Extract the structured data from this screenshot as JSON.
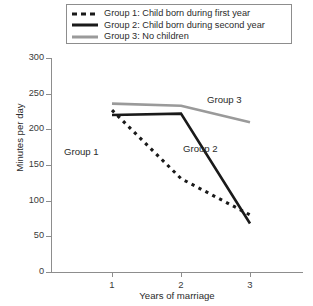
{
  "legend": {
    "items": [
      {
        "label": "Group 1: Child born during first year",
        "style": "dotted",
        "color": "#1a1a1a",
        "icon": "dotted-line-swatch"
      },
      {
        "label": "Group 2: Child born during second year",
        "style": "solid",
        "color": "#1a1a1a",
        "icon": "solid-line-swatch"
      },
      {
        "label": "Group 3: No children",
        "style": "solid",
        "color": "#9a9a9a",
        "icon": "solid-line-swatch"
      }
    ]
  },
  "annotations": {
    "group1": "Group 1",
    "group2": "Group 2",
    "group3": "Group 3"
  },
  "axes": {
    "y_ticks": [
      "300",
      "250",
      "200",
      "150",
      "100",
      "50",
      "0"
    ],
    "x_ticks": [
      "1",
      "2",
      "3"
    ],
    "ylabel": "Minutes per day",
    "xlabel": "Years of marriage"
  },
  "chart_data": {
    "type": "line",
    "title": "",
    "xlabel": "Years of marriage",
    "ylabel": "Minutes per day",
    "x": [
      1,
      2,
      3
    ],
    "xlim": [
      0.6,
      3.6
    ],
    "ylim": [
      0,
      300
    ],
    "yticks": [
      0,
      50,
      100,
      150,
      200,
      250,
      300
    ],
    "xticks": [
      1,
      2,
      3
    ],
    "grid": false,
    "legend_position": "top",
    "series": [
      {
        "name": "Group 1: Child born during first year",
        "short_name": "Group 1",
        "linestyle": "dotted",
        "color": "#1a1a1a",
        "values": [
          227,
          131,
          80
        ]
      },
      {
        "name": "Group 2: Child born during second year",
        "short_name": "Group 2",
        "linestyle": "solid",
        "color": "#1a1a1a",
        "values": [
          220,
          222,
          68
        ]
      },
      {
        "name": "Group 3: No children",
        "short_name": "Group 3",
        "linestyle": "solid",
        "color": "#9a9a9a",
        "values": [
          236,
          233,
          210
        ]
      }
    ]
  }
}
